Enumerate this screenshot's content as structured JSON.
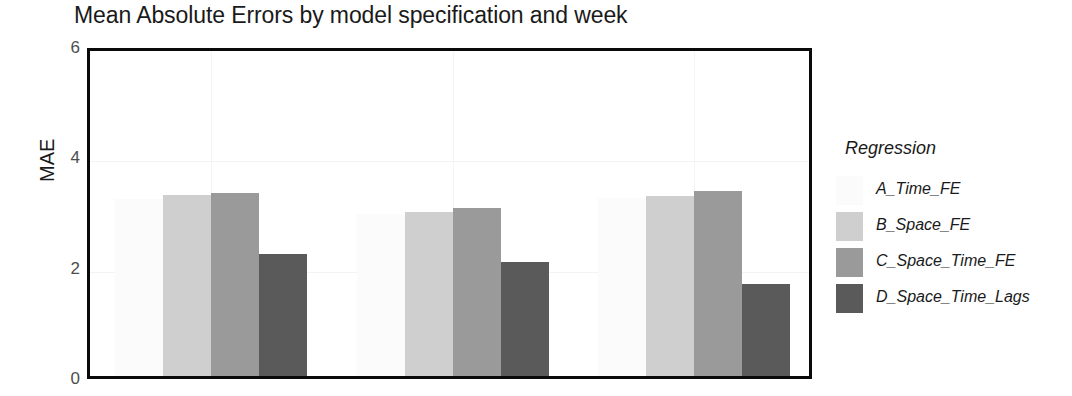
{
  "chart_data": {
    "type": "bar",
    "title": "Mean Absolute Errors by model specification and week",
    "xlabel": "",
    "ylabel": "MAE",
    "ylim": [
      0,
      6
    ],
    "yticks": [
      "0",
      "2",
      "4",
      "6"
    ],
    "ytick_values": [
      0,
      2,
      4,
      6
    ],
    "grid": true,
    "grid_axis": "both",
    "legend_title": "Regression",
    "legend_position": "right",
    "categories": [
      "week 1",
      "week 2",
      "week 3"
    ],
    "series": [
      {
        "name": "A_Time_FE",
        "color": "#fbfbfb",
        "values": [
          3.21,
          2.93,
          3.22
        ]
      },
      {
        "name": "B_Space_FE",
        "color": "#cfcfcf",
        "values": [
          3.28,
          2.97,
          3.26
        ]
      },
      {
        "name": "C_Space_Time_FE",
        "color": "#9a9a9a",
        "values": [
          3.32,
          3.04,
          3.35
        ]
      },
      {
        "name": "D_Space_Time_Lags",
        "color": "#5a5a5a",
        "values": [
          2.21,
          2.07,
          1.67
        ]
      }
    ]
  },
  "axis": {
    "y_title": "MAE"
  },
  "legend": {
    "title": "Regression",
    "entries": [
      {
        "label": "A_Time_FE",
        "color": "#fbfbfb"
      },
      {
        "label": "B_Space_FE",
        "color": "#cfcfcf"
      },
      {
        "label": "C_Space_Time_FE",
        "color": "#9a9a9a"
      },
      {
        "label": "D_Space_Time_Lags",
        "color": "#5a5a5a"
      }
    ]
  },
  "style": {
    "frame_color": "#0a0a0a",
    "background": "#ffffff",
    "grid_color": "#f3f3f3",
    "text_color": "#1a1a1a",
    "tick_color": "#4d4d4d"
  }
}
